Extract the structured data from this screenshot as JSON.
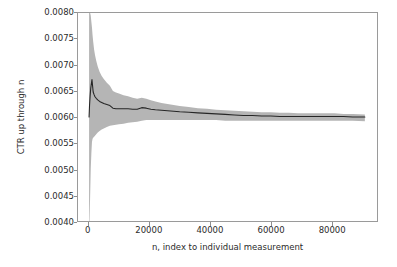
{
  "chart_data": {
    "type": "line",
    "title": "",
    "subtitle": "",
    "xlabel": "n, index to individual measurement",
    "ylabel": "CTR up through n",
    "xlim": [
      -3500,
      95000
    ],
    "ylim": [
      0.004,
      0.008
    ],
    "xticks": [
      0,
      20000,
      40000,
      60000,
      80000
    ],
    "xticklabels": [
      "0",
      "20000",
      "40000",
      "60000",
      "80000"
    ],
    "yticks": [
      0.004,
      0.0045,
      0.005,
      0.0055,
      0.006,
      0.0065,
      0.007,
      0.0075,
      0.008
    ],
    "yticklabels": [
      "0.0040",
      "0.0045",
      "0.0050",
      "0.0055",
      "0.0060",
      "0.0065",
      "0.0070",
      "0.0075",
      "0.0080"
    ],
    "grid": false,
    "legend": false,
    "legend_position": "none",
    "line_color": "#262626",
    "band_color": "#b5b5b5",
    "frame_color": "#9a9a9a",
    "background": "#ffffff",
    "data_n_max": 91000,
    "asymptote": 0.006,
    "annotations": [],
    "series": [
      {
        "name": "CTR up through n",
        "role": "mean",
        "x": [
          150,
          300,
          500,
          700,
          900,
          1100,
          1300,
          1500,
          1800,
          2100,
          2500,
          3000,
          3600,
          4300,
          5000,
          6000,
          7000,
          8000,
          9000,
          10000,
          11500,
          13000,
          14500,
          16000,
          17500,
          19000,
          20500,
          22000,
          24000,
          26000,
          28000,
          30000,
          33000,
          36000,
          39000,
          42000,
          45000,
          48000,
          51000,
          54000,
          57000,
          60000,
          63000,
          66000,
          69000,
          72000,
          75000,
          78000,
          81000,
          84000,
          87000,
          91000
        ],
        "y": [
          0.006,
          0.00622,
          0.00641,
          0.00655,
          0.00664,
          0.00672,
          0.0066,
          0.00648,
          0.00643,
          0.00639,
          0.00636,
          0.00633,
          0.0063,
          0.00628,
          0.00626,
          0.00624,
          0.00622,
          0.00617,
          0.00616,
          0.00616,
          0.00616,
          0.00616,
          0.00615,
          0.00615,
          0.00618,
          0.00617,
          0.00615,
          0.00614,
          0.00613,
          0.00612,
          0.00611,
          0.0061,
          0.00609,
          0.00608,
          0.00607,
          0.00606,
          0.00605,
          0.00604,
          0.00603,
          0.00603,
          0.00602,
          0.00602,
          0.00601,
          0.00601,
          0.00601,
          0.00601,
          0.00601,
          0.00601,
          0.00601,
          0.00601,
          0.006,
          0.006
        ]
      },
      {
        "name": "confidence band upper",
        "role": "band_upper",
        "x": [
          150,
          300,
          500,
          700,
          900,
          1100,
          1300,
          1500,
          1800,
          2100,
          2500,
          3000,
          3600,
          4300,
          5000,
          6000,
          7000,
          8000,
          9000,
          10000,
          11500,
          13000,
          14500,
          16000,
          17500,
          19000,
          20500,
          22000,
          24000,
          26000,
          28000,
          30000,
          33000,
          36000,
          39000,
          42000,
          45000,
          48000,
          51000,
          54000,
          57000,
          60000,
          63000,
          66000,
          69000,
          72000,
          75000,
          78000,
          81000,
          84000,
          87000,
          91000
        ],
        "y": [
          0.008,
          0.008,
          0.008,
          0.00795,
          0.00783,
          0.00772,
          0.00757,
          0.00745,
          0.0073,
          0.00719,
          0.00708,
          0.00697,
          0.00687,
          0.00679,
          0.00673,
          0.00666,
          0.0066,
          0.0065,
          0.00647,
          0.00645,
          0.00642,
          0.0064,
          0.00637,
          0.00635,
          0.00637,
          0.00635,
          0.00632,
          0.0063,
          0.00627,
          0.00625,
          0.00623,
          0.00621,
          0.00619,
          0.00617,
          0.00616,
          0.00614,
          0.00613,
          0.00612,
          0.00611,
          0.0061,
          0.00609,
          0.00609,
          0.00608,
          0.00608,
          0.00607,
          0.00607,
          0.00607,
          0.00607,
          0.00607,
          0.00606,
          0.00606,
          0.00605
        ]
      },
      {
        "name": "confidence band lower",
        "role": "band_lower",
        "x": [
          150,
          300,
          500,
          700,
          900,
          1100,
          1300,
          1500,
          1800,
          2100,
          2500,
          3000,
          3600,
          4300,
          5000,
          6000,
          7000,
          8000,
          9000,
          10000,
          11500,
          13000,
          14500,
          16000,
          17500,
          19000,
          20500,
          22000,
          24000,
          26000,
          28000,
          30000,
          33000,
          36000,
          39000,
          42000,
          45000,
          48000,
          51000,
          54000,
          57000,
          60000,
          63000,
          66000,
          69000,
          72000,
          75000,
          78000,
          81000,
          84000,
          87000,
          91000
        ],
        "y": [
          0.004,
          0.004,
          0.00448,
          0.005,
          0.0053,
          0.00552,
          0.00558,
          0.0056,
          0.00562,
          0.00564,
          0.00567,
          0.0057,
          0.00573,
          0.00576,
          0.00578,
          0.00581,
          0.00583,
          0.00584,
          0.00585,
          0.00586,
          0.00587,
          0.00589,
          0.0059,
          0.00591,
          0.00593,
          0.00594,
          0.00594,
          0.00594,
          0.00594,
          0.00594,
          0.00594,
          0.00594,
          0.00594,
          0.00594,
          0.00594,
          0.00594,
          0.00593,
          0.00593,
          0.00593,
          0.00593,
          0.00593,
          0.00593,
          0.00593,
          0.00593,
          0.00593,
          0.00593,
          0.00593,
          0.00593,
          0.00593,
          0.00593,
          0.00593,
          0.00592
        ]
      }
    ]
  }
}
